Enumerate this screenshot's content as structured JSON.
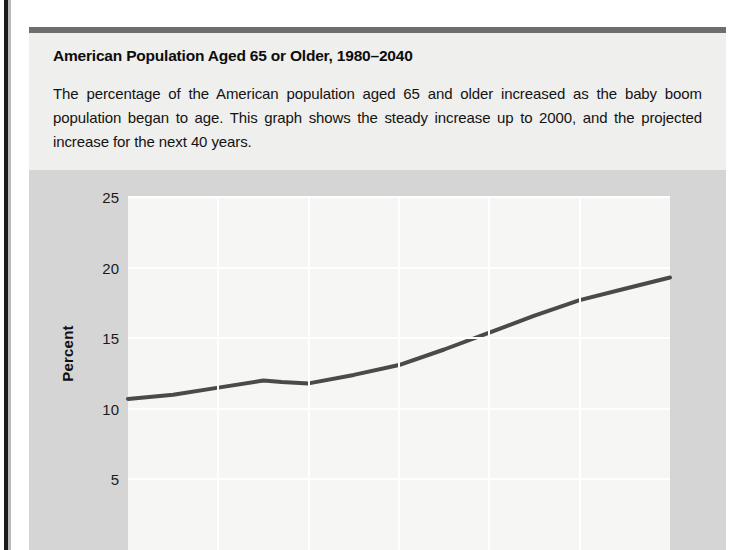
{
  "caption": {
    "title": "American Population Aged 65 or Older, 1980–2040",
    "body": "The percentage of the American population aged 65 and older increased as the baby boom population began to age. This graph shows the steady increase up to 2000, and the projected increase for the next 40 years."
  },
  "chart_data": {
    "type": "line",
    "title": "American Population Aged 65 or Older, 1980–2040",
    "xlabel": "",
    "ylabel": "Percent",
    "ylim": [
      0,
      25
    ],
    "xlim": [
      1980,
      2040
    ],
    "yticks": [
      25,
      20,
      15,
      10,
      5
    ],
    "ytick_labels": [
      "25",
      "20",
      "15",
      "10",
      "5"
    ],
    "xticks": [
      1980,
      1990,
      2000,
      2010,
      2020,
      2030,
      2040
    ],
    "xtick_labels": [
      "",
      "",
      "",
      "",
      "",
      "",
      ""
    ],
    "grid": true,
    "legend": "none",
    "series": [
      {
        "name": "Percent aged 65 or older",
        "color": "#4a4a4a",
        "x": [
          1980,
          1985,
          1990,
          1995,
          1997,
          2000,
          2005,
          2010,
          2015,
          2020,
          2025,
          2030,
          2035,
          2040
        ],
        "values": [
          10.7,
          11.0,
          11.5,
          12.0,
          11.9,
          11.8,
          12.4,
          13.1,
          14.2,
          15.4,
          16.6,
          17.7,
          18.5,
          19.3
        ]
      }
    ]
  },
  "axis": {
    "y_label": "Percent",
    "y_ticks": [
      "25",
      "20",
      "15",
      "10",
      "5"
    ]
  },
  "colors": {
    "panel_background": "#d5d5d5",
    "plot_background": "#f6f6f4",
    "gridline": "#ffffff",
    "series_line": "#4a4a4a",
    "caption_background": "#efefed",
    "caption_rule": "#6e6e6e"
  }
}
